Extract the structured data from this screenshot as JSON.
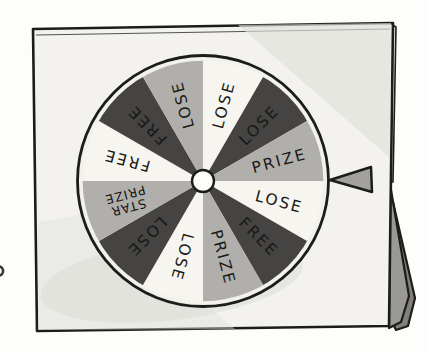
{
  "board": {
    "face_color": "#f3f2ee",
    "side_color": "#eceae5",
    "wash_color": "#e1e0db",
    "shadow_color": "#dcdbd6",
    "outline_color": "#1c1c1a"
  },
  "stand": {
    "front_color": "#9b9994",
    "back_color": "#827f78",
    "outline_color": "#1c1c1a"
  },
  "pointer": {
    "shape": "left-pointing-triangle",
    "color": "#a3a19d",
    "outline_color": "#1c1c1a"
  },
  "wheel": {
    "outline_color": "#1c1c1a",
    "inner_ring_color": "#f2f1ec",
    "hub_color": "#fdfdfa",
    "label_color": "#181816",
    "tones": {
      "light": "#f6f5f0",
      "mid": "#b1afac",
      "dark": "#454442"
    },
    "segments": [
      {
        "label": "LOSE",
        "tone": "light"
      },
      {
        "label": "LOSE",
        "tone": "dark"
      },
      {
        "label": "PRIZE",
        "tone": "mid"
      },
      {
        "label": "LOSE",
        "tone": "light"
      },
      {
        "label": "FREE",
        "tone": "dark"
      },
      {
        "label": "PRIZE",
        "tone": "mid"
      },
      {
        "label": "LOSE",
        "tone": "light"
      },
      {
        "label": "LOSE",
        "tone": "dark"
      },
      {
        "label": "STAR PRIZE",
        "tone": "mid",
        "lines": [
          "STAR",
          "PRIZE"
        ]
      },
      {
        "label": "FREE",
        "tone": "light"
      },
      {
        "label": "FREE",
        "tone": "dark"
      },
      {
        "label": "LOSE",
        "tone": "mid"
      }
    ]
  },
  "edge_mark": {
    "color": "#3a3a36"
  }
}
